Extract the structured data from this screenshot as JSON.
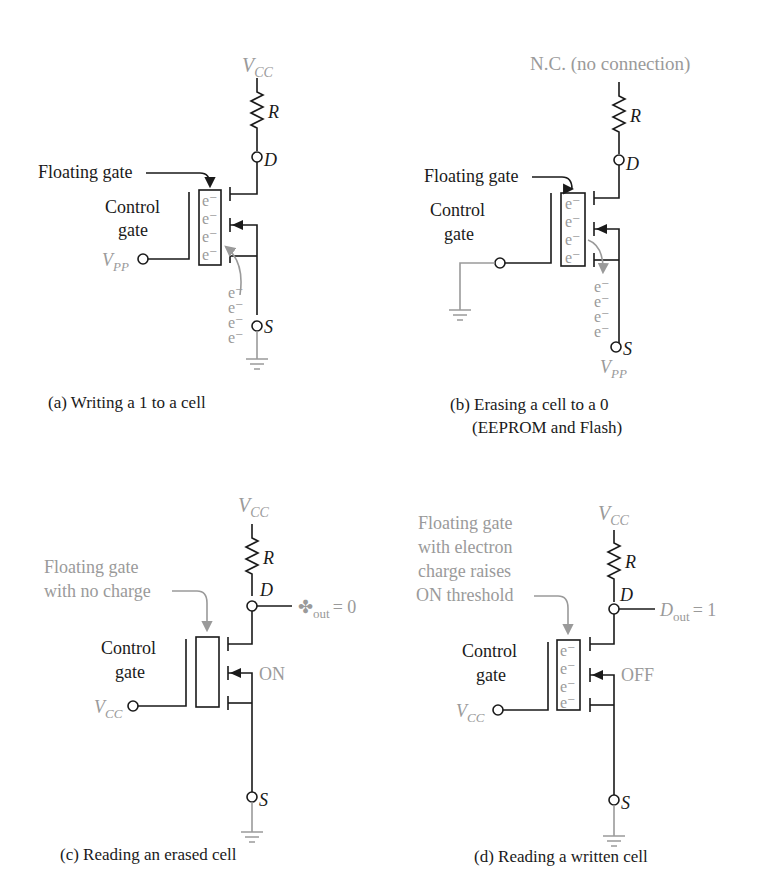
{
  "panels": {
    "a": {
      "caption": "(a) Writing a 1 to a cell",
      "supply": "V",
      "supply_sub": "CC",
      "resistor": "R",
      "drain": "D",
      "source": "S",
      "floating_gate_label": "Floating gate",
      "control_gate_line1": "Control",
      "control_gate_line2": "gate",
      "gate_input": "V",
      "gate_input_sub": "PP",
      "electron": "e⁻"
    },
    "b": {
      "caption_line1": "(b) Erasing a cell to a 0",
      "caption_line2": "(EEPROM and Flash)",
      "supply": "N.C. (no connection)",
      "resistor": "R",
      "drain": "D",
      "source": "S",
      "source_input": "V",
      "source_input_sub": "PP",
      "floating_gate_label": "Floating gate",
      "control_gate_line1": "Control",
      "control_gate_line2": "gate",
      "electron": "e⁻"
    },
    "c": {
      "caption": "(c) Reading an erased cell",
      "supply": "V",
      "supply_sub": "CC",
      "resistor": "R",
      "drain": "D",
      "source": "S",
      "floating_gate_line1": "Floating gate",
      "floating_gate_line2": "with no charge",
      "control_gate_line1": "Control",
      "control_gate_line2": "gate",
      "gate_input": "V",
      "gate_input_sub": "CC",
      "state": "ON",
      "output_symbol": "✤",
      "output_sub": "out",
      "output_value": "= 0"
    },
    "d": {
      "caption": "(d) Reading a written cell",
      "supply": "V",
      "supply_sub": "CC",
      "resistor": "R",
      "drain": "D",
      "source": "S",
      "floating_gate_line1": "Floating gate",
      "floating_gate_line2": "with electron",
      "floating_gate_line3": "charge raises",
      "floating_gate_line4": "ON threshold",
      "control_gate_line1": "Control",
      "control_gate_line2": "gate",
      "gate_input": "V",
      "gate_input_sub": "CC",
      "state": "OFF",
      "output_symbol": "D",
      "output_sub": "out",
      "output_value": "= 1",
      "electron": "e⁻"
    }
  },
  "colors": {
    "ink": "#1a1a1a",
    "grey": "#9a9a9a"
  }
}
